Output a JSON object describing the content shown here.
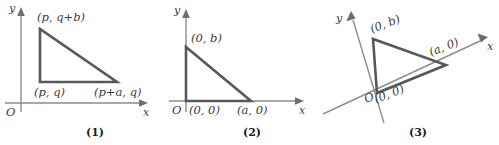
{
  "figure": {
    "panels": [
      {
        "caption": "(1)",
        "axis_x_label": "x",
        "axis_y_label": "y",
        "origin_label": "O",
        "vertex_labels": {
          "top": "(p, q+b)",
          "bottom_left": "(p, q)",
          "bottom_right": "(p+a, q)"
        }
      },
      {
        "caption": "(2)",
        "axis_x_label": "x",
        "axis_y_label": "y",
        "origin_label": "O",
        "vertex_labels": {
          "top": "(0, b)",
          "bottom_left": "(0, 0)",
          "bottom_right": "(a, 0)"
        }
      },
      {
        "caption": "(3)",
        "axis_x_label": "x",
        "axis_y_label": "y",
        "origin_label": "O",
        "vertex_labels": {
          "top": "(0, b)",
          "bottom_left": "(0, 0)",
          "bottom_right": "(a, 0)"
        }
      }
    ],
    "colors": {
      "triangle_stroke": "#58585a",
      "axis_stroke": "#8d8d8d",
      "text": "#3b3b3b",
      "caption": "#1d1d1d",
      "background": "#ffffff"
    }
  }
}
